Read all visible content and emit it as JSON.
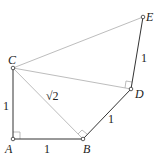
{
  "diagram": {
    "type": "geometry",
    "points": {
      "A": {
        "label": "A",
        "x": 13,
        "y": 139
      },
      "B": {
        "label": "B",
        "x": 83,
        "y": 139
      },
      "C": {
        "label": "C",
        "x": 13,
        "y": 68
      },
      "D": {
        "label": "D",
        "x": 131,
        "y": 89
      },
      "E": {
        "label": "E",
        "x": 143,
        "y": 17
      }
    },
    "segments": [
      {
        "from": "A",
        "to": "B",
        "style": "dark",
        "length_label": "1"
      },
      {
        "from": "A",
        "to": "C",
        "style": "dark",
        "length_label": "1"
      },
      {
        "from": "B",
        "to": "D",
        "style": "dark",
        "length_label": "1"
      },
      {
        "from": "D",
        "to": "E",
        "style": "dark",
        "length_label": "1"
      },
      {
        "from": "C",
        "to": "B",
        "style": "light",
        "length_label": "√2"
      },
      {
        "from": "C",
        "to": "D",
        "style": "light",
        "length_label": ""
      },
      {
        "from": "C",
        "to": "E",
        "style": "light",
        "length_label": ""
      }
    ],
    "right_angles": [
      "A",
      "B",
      "D"
    ],
    "labels": {
      "A": "A",
      "B": "B",
      "C": "C",
      "D": "D",
      "E": "E",
      "AB": "1",
      "AC": "1",
      "BD": "1",
      "DE": "1",
      "CB": "√2"
    },
    "colors": {
      "dark_line": "#333333",
      "light_line": "#bdbdbd",
      "text": "#222222"
    }
  }
}
